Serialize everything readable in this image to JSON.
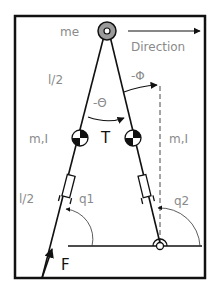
{
  "diagram": {
    "labels": {
      "mass_end": "me",
      "direction": "Direction",
      "half_length_top": "l/2",
      "phi": "-Φ",
      "theta": "-Θ",
      "torque": "T",
      "mass_inertia_left": "m,I",
      "mass_inertia_right": "m,I",
      "half_length_bottom": "l/2",
      "q1": "q1",
      "q2": "q2",
      "force": "F"
    },
    "colors": {
      "line": "#111111",
      "label": "#8a8a8a",
      "hip_mass": "#9a9a9a",
      "background": "#ffffff"
    }
  }
}
